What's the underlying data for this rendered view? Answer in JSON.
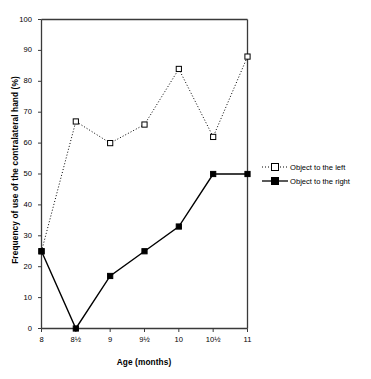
{
  "chart_data": {
    "type": "line",
    "title": "",
    "xlabel": "Age (months)",
    "ylabel": "Frequency of use of the contralateral hand (%)",
    "categories": [
      "8",
      "8½",
      "9",
      "9½",
      "10",
      "10½",
      "11"
    ],
    "x": [
      8,
      8.5,
      9,
      9.5,
      10,
      10.5,
      11
    ],
    "xlim": [
      8,
      11
    ],
    "ylim": [
      0,
      100
    ],
    "ytick_labels": [
      "0",
      "10",
      "20",
      "30",
      "40",
      "50",
      "60",
      "70",
      "80",
      "90",
      "100"
    ],
    "yticks": [
      0,
      10,
      20,
      30,
      40,
      50,
      60,
      70,
      80,
      90,
      100
    ],
    "grid": false,
    "legend_position": "right",
    "series": [
      {
        "name": "Object to the left",
        "values": [
          25,
          67,
          60,
          66,
          84,
          62,
          88
        ],
        "line_style": "dotted",
        "marker": "open-square",
        "color": "#000000"
      },
      {
        "name": "Object to the right",
        "values": [
          25,
          0,
          17,
          25,
          33,
          50,
          50
        ],
        "line_style": "solid",
        "marker": "filled-square",
        "color": "#000000"
      }
    ]
  },
  "legend": {
    "entries": [
      {
        "label": "Object to the left"
      },
      {
        "label": "Object to the right"
      }
    ]
  }
}
